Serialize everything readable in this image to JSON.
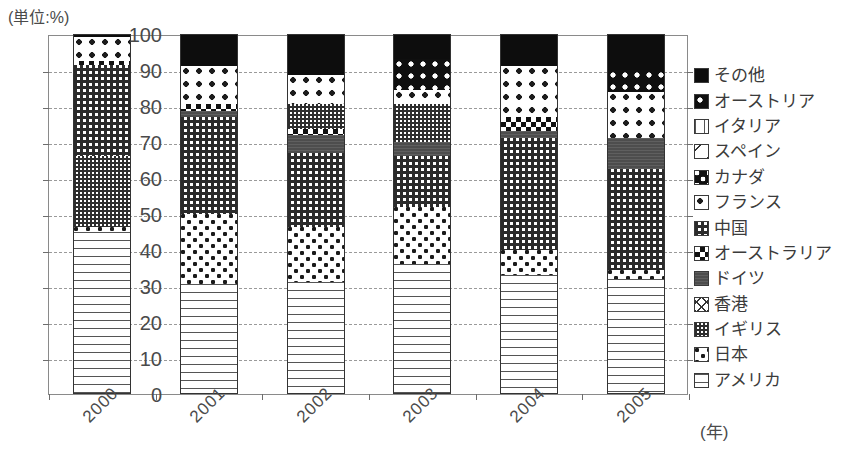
{
  "chart_data": {
    "type": "bar",
    "variant": "stacked-100-percent",
    "title": "",
    "unit_label": "(単位:%)",
    "xlabel": "(年)",
    "ylabel": "",
    "ylim": [
      0,
      100
    ],
    "ytick_step": 10,
    "ytick_labels": [
      "100",
      "90",
      "80",
      "70",
      "60",
      "50",
      "40",
      "30",
      "20",
      "10",
      "0"
    ],
    "ytick_values": [
      100,
      90,
      80,
      70,
      60,
      50,
      40,
      30,
      20,
      10,
      0
    ],
    "grid": true,
    "grid_style": "dashed-horizontal",
    "legend_position": "right",
    "legend_order_top_to_bottom": [
      "その他",
      "オーストリア",
      "イタリア",
      "スペイン",
      "カナダ",
      "フランス",
      "中国",
      "オーストラリア",
      "ドイツ",
      "香港",
      "イギリス",
      "日本",
      "アメリカ"
    ],
    "categories": [
      "2000",
      "2001",
      "2002",
      "2003",
      "2004",
      "2005"
    ],
    "series": [
      {
        "name": "アメリカ",
        "pattern": "horizontal-lines",
        "values": [
          45.0,
          30.5,
          31.0,
          36.0,
          33.0,
          32.0
        ]
      },
      {
        "name": "日本",
        "pattern": "white-corner-dots",
        "values": [
          1.5,
          19.5,
          15.5,
          16.0,
          7.0,
          2.5
        ]
      },
      {
        "name": "イギリス",
        "pattern": "fine-checker",
        "values": [
          19.5,
          0.0,
          0.0,
          0.0,
          0.0,
          0.0
        ]
      },
      {
        "name": "香港",
        "pattern": "diagonal-cross",
        "values": [
          0.0,
          0.0,
          0.0,
          0.0,
          0.0,
          0.0
        ]
      },
      {
        "name": "中国",
        "pattern": "checker-weave",
        "values": [
          26.0,
          27.0,
          20.5,
          14.0,
          31.0,
          28.0
        ]
      },
      {
        "name": "ドイツ",
        "pattern": "solid-dark-gray",
        "values": [
          0.0,
          1.5,
          5.0,
          4.0,
          2.0,
          8.5
        ]
      },
      {
        "name": "オーストラリア",
        "pattern": "block-checker",
        "values": [
          1.0,
          2.0,
          1.5,
          0.0,
          4.0,
          0.0
        ]
      },
      {
        "name": "フランス",
        "pattern": "white-black-dots",
        "values": [
          6.5,
          10.5,
          15.0,
          6.5,
          14.0,
          13.0
        ]
      },
      {
        "name": "カナダ",
        "pattern": "black-white-blobs",
        "values": [
          0.0,
          0.0,
          0.0,
          0.0,
          0.0,
          0.0
        ]
      },
      {
        "name": "スペイン",
        "pattern": "diagonal-slash",
        "values": [
          0.0,
          0.0,
          0.0,
          0.0,
          0.0,
          0.0
        ]
      },
      {
        "name": "イタリア",
        "pattern": "vertical-bars",
        "values": [
          0.0,
          0.0,
          0.0,
          0.0,
          0.0,
          0.0
        ]
      },
      {
        "name": "オーストリア",
        "pattern": "black-white-dots",
        "values": [
          0.0,
          0.0,
          0.0,
          8.5,
          0.0,
          6.0
        ]
      },
      {
        "name": "その他",
        "pattern": "solid-black",
        "values": [
          0.5,
          9.0,
          11.5,
          15.0,
          9.0,
          10.0
        ]
      }
    ],
    "stacks": [
      {
        "year": "2000",
        "segments": [
          {
            "name": "アメリカ",
            "from": 0.0,
            "to": 45.0,
            "pattern": "p-usa"
          },
          {
            "name": "日本",
            "from": 45.0,
            "to": 46.5,
            "pattern": "p-japan"
          },
          {
            "name": "イギリス",
            "from": 46.5,
            "to": 66.0,
            "pattern": "p-uk"
          },
          {
            "name": "中国",
            "from": 66.0,
            "to": 91.5,
            "pattern": "p-china"
          },
          {
            "name": "オーストラリア",
            "from": 91.5,
            "to": 92.5,
            "pattern": "p-australia"
          },
          {
            "name": "フランス",
            "from": 92.5,
            "to": 99.3,
            "pattern": "p-france"
          },
          {
            "name": "その他",
            "from": 99.3,
            "to": 100.0,
            "pattern": "p-other"
          }
        ]
      },
      {
        "year": "2001",
        "segments": [
          {
            "name": "アメリカ",
            "from": 0.0,
            "to": 30.5,
            "pattern": "p-usa"
          },
          {
            "name": "日本",
            "from": 30.5,
            "to": 50.0,
            "pattern": "p-japan"
          },
          {
            "name": "中国",
            "from": 50.0,
            "to": 77.0,
            "pattern": "p-china"
          },
          {
            "name": "ドイツ",
            "from": 77.0,
            "to": 78.5,
            "pattern": "p-germany"
          },
          {
            "name": "オーストラリア",
            "from": 78.5,
            "to": 80.5,
            "pattern": "p-australia"
          },
          {
            "name": "フランス",
            "from": 80.5,
            "to": 91.0,
            "pattern": "p-france"
          },
          {
            "name": "その他",
            "from": 91.0,
            "to": 100.0,
            "pattern": "p-other"
          }
        ]
      },
      {
        "year": "2002",
        "segments": [
          {
            "name": "アメリカ",
            "from": 0.0,
            "to": 31.0,
            "pattern": "p-usa"
          },
          {
            "name": "日本",
            "from": 31.0,
            "to": 46.5,
            "pattern": "p-japan"
          },
          {
            "name": "中国",
            "from": 46.5,
            "to": 67.0,
            "pattern": "p-china"
          },
          {
            "name": "ドイツ",
            "from": 67.0,
            "to": 72.0,
            "pattern": "p-germany"
          },
          {
            "name": "オーストラリア",
            "from": 72.0,
            "to": 73.5,
            "pattern": "p-australia"
          },
          {
            "name": "イギリス",
            "from": 73.5,
            "to": 80.5,
            "pattern": "p-uk"
          },
          {
            "name": "フランス",
            "from": 80.5,
            "to": 88.5,
            "pattern": "p-france"
          },
          {
            "name": "その他",
            "from": 88.5,
            "to": 100.0,
            "pattern": "p-other"
          }
        ]
      },
      {
        "year": "2003",
        "segments": [
          {
            "name": "アメリカ",
            "from": 0.0,
            "to": 36.0,
            "pattern": "p-usa"
          },
          {
            "name": "日本",
            "from": 36.0,
            "to": 52.0,
            "pattern": "p-japan"
          },
          {
            "name": "中国",
            "from": 52.0,
            "to": 66.0,
            "pattern": "p-china"
          },
          {
            "name": "ドイツ",
            "from": 66.0,
            "to": 70.0,
            "pattern": "p-germany"
          },
          {
            "name": "イギリス",
            "from": 70.0,
            "to": 80.5,
            "pattern": "p-uk"
          },
          {
            "name": "フランス",
            "from": 80.5,
            "to": 84.5,
            "pattern": "p-france"
          },
          {
            "name": "オーストリア",
            "from": 84.5,
            "to": 93.0,
            "pattern": "p-austria"
          },
          {
            "name": "その他",
            "from": 93.0,
            "to": 100.0,
            "pattern": "p-other"
          }
        ]
      },
      {
        "year": "2004",
        "segments": [
          {
            "name": "アメリカ",
            "from": 0.0,
            "to": 33.0,
            "pattern": "p-usa"
          },
          {
            "name": "日本",
            "from": 33.0,
            "to": 40.0,
            "pattern": "p-japan"
          },
          {
            "name": "中国",
            "from": 40.0,
            "to": 71.0,
            "pattern": "p-china"
          },
          {
            "name": "ドイツ",
            "from": 71.0,
            "to": 73.0,
            "pattern": "p-germany"
          },
          {
            "name": "オーストラリア",
            "from": 73.0,
            "to": 77.0,
            "pattern": "p-australia"
          },
          {
            "name": "フランス",
            "from": 77.0,
            "to": 91.0,
            "pattern": "p-france"
          },
          {
            "name": "その他",
            "from": 91.0,
            "to": 100.0,
            "pattern": "p-other"
          }
        ]
      },
      {
        "year": "2005",
        "segments": [
          {
            "name": "アメリカ",
            "from": 0.0,
            "to": 32.0,
            "pattern": "p-usa"
          },
          {
            "name": "日本",
            "from": 32.0,
            "to": 34.5,
            "pattern": "p-japan"
          },
          {
            "name": "中国",
            "from": 34.5,
            "to": 62.5,
            "pattern": "p-china"
          },
          {
            "name": "ドイツ",
            "from": 62.5,
            "to": 71.0,
            "pattern": "p-germany"
          },
          {
            "name": "フランス",
            "from": 71.0,
            "to": 84.0,
            "pattern": "p-france"
          },
          {
            "name": "オーストリア",
            "from": 84.0,
            "to": 90.0,
            "pattern": "p-austria"
          },
          {
            "name": "その他",
            "from": 90.0,
            "to": 100.0,
            "pattern": "p-other"
          }
        ]
      }
    ]
  },
  "legend": {
    "items": [
      {
        "label": "その他",
        "pattern": "p-other"
      },
      {
        "label": "オーストリア",
        "pattern": "p-austria"
      },
      {
        "label": "イタリア",
        "pattern": "p-italy"
      },
      {
        "label": "スペイン",
        "pattern": "p-spain"
      },
      {
        "label": "カナダ",
        "pattern": "p-canada"
      },
      {
        "label": "フランス",
        "pattern": "p-france"
      },
      {
        "label": "中国",
        "pattern": "p-china"
      },
      {
        "label": "オーストラリア",
        "pattern": "p-australia"
      },
      {
        "label": "ドイツ",
        "pattern": "p-germany"
      },
      {
        "label": "香港",
        "pattern": "p-hk"
      },
      {
        "label": "イギリス",
        "pattern": "p-uk"
      },
      {
        "label": "日本",
        "pattern": "p-japan"
      },
      {
        "label": "アメリカ",
        "pattern": "p-usa"
      }
    ]
  },
  "colors": {
    "axis": "#8a8a8a",
    "grid": "#9a9a9a",
    "text": "#3b3b3b",
    "ink": "#0d0d0d",
    "paper": "#ffffff",
    "gray_fill": "#4d4d4d"
  }
}
